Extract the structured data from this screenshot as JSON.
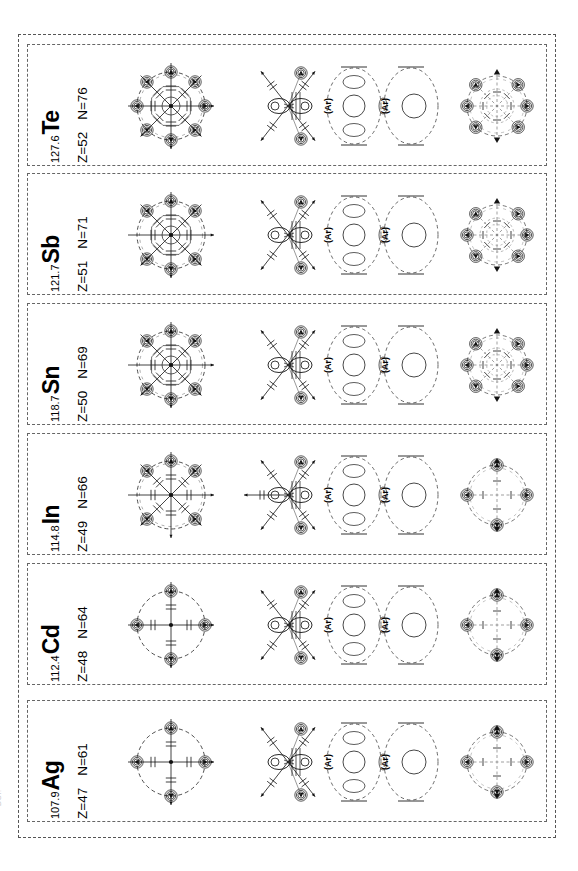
{
  "figure": {
    "kind": "atomic-orbital-shell-diagrams",
    "orientation": "rotated-90-ccw",
    "edge_caption": "DOI:",
    "core_label": "(Ar)",
    "panel_count": 6
  },
  "elements": [
    {
      "symbol": "Te",
      "mass": "127.6",
      "z_label": "Z=52",
      "n_label": "N=76",
      "outer_markers": 8,
      "core_labels": [
        "(Ar)",
        "(Ar)"
      ]
    },
    {
      "symbol": "Sb",
      "mass": "121.7",
      "z_label": "Z=51",
      "n_label": "N=71",
      "outer_markers": 6,
      "core_labels": [
        "(Ar)",
        "(Ar)"
      ]
    },
    {
      "symbol": "Sn",
      "mass": "118.7",
      "z_label": "Z=50",
      "n_label": "N=69",
      "outer_markers": 6,
      "core_labels": [
        "(Ar)",
        "(Ar)"
      ]
    },
    {
      "symbol": "In",
      "mass": "114.8",
      "z_label": "Z=49",
      "n_label": "N=66",
      "outer_markers": 5,
      "core_labels": [
        "(Ar)",
        "(Ar)"
      ]
    },
    {
      "symbol": "Cd",
      "mass": "112.4",
      "z_label": "Z=48",
      "n_label": "N=64",
      "outer_markers": 4,
      "core_labels": [
        "(Ar)",
        "(Ar)"
      ]
    },
    {
      "symbol": "Ag",
      "mass": "107.9",
      "z_label": "Z=47",
      "n_label": "N=61",
      "outer_markers": 4,
      "core_labels": [
        "(Ar)",
        "(Ar)"
      ]
    }
  ]
}
